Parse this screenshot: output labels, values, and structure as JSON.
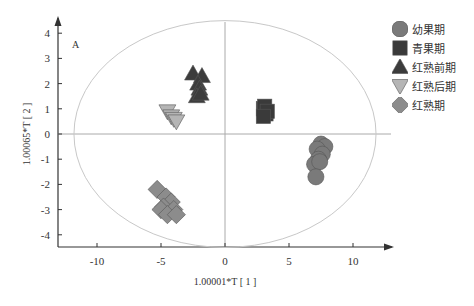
{
  "chart_data": {
    "type": "scatter",
    "title": "",
    "panel_label": "A",
    "xlabel": "1.00001*T [ 1 ]",
    "ylabel": "1.00065*T [ 2 ]",
    "xlim": [
      -13,
      13
    ],
    "ylim": [
      -4.5,
      4.5
    ],
    "xticks": [
      -10,
      -5,
      0,
      5,
      10
    ],
    "yticks": [
      -4,
      -3,
      -2,
      -1,
      0,
      1,
      2,
      3,
      4
    ],
    "grid": false,
    "legend_position": "right",
    "confidence_ellipse": {
      "cx": 0,
      "cy": 0,
      "rx": 11.8,
      "ry": 4.5
    },
    "series": [
      {
        "name": "幼果期",
        "marker": "circle",
        "color": "#7a7a7a",
        "points": [
          [
            7.5,
            -0.4
          ],
          [
            7.8,
            -0.5
          ],
          [
            7.2,
            -0.6
          ],
          [
            7.6,
            -0.8
          ],
          [
            7.3,
            -1.0
          ],
          [
            7.0,
            -1.2
          ],
          [
            7.4,
            -1.1
          ],
          [
            7.1,
            -1.7
          ]
        ]
      },
      {
        "name": "青果期",
        "marker": "square",
        "color": "#3a3a3a",
        "points": [
          [
            3.0,
            1.0
          ],
          [
            3.2,
            0.8
          ],
          [
            3.1,
            1.1
          ],
          [
            3.3,
            0.9
          ],
          [
            3.0,
            0.7
          ]
        ]
      },
      {
        "name": "红熟前期",
        "marker": "triangle-up",
        "color": "#3c3c3c",
        "points": [
          [
            -2.5,
            2.4
          ],
          [
            -1.8,
            2.3
          ],
          [
            -2.1,
            2.0
          ],
          [
            -2.0,
            1.8
          ],
          [
            -2.2,
            1.5
          ],
          [
            -1.9,
            1.6
          ]
        ]
      },
      {
        "name": "红熟后期",
        "marker": "triangle-down",
        "color": "#b5b5b5",
        "points": [
          [
            -4.5,
            0.9
          ],
          [
            -4.2,
            0.7
          ],
          [
            -4.0,
            0.6
          ],
          [
            -3.8,
            0.5
          ]
        ]
      },
      {
        "name": "红熟期",
        "marker": "diamond",
        "color": "#8c8c8c",
        "points": [
          [
            -5.3,
            -2.2
          ],
          [
            -4.6,
            -2.5
          ],
          [
            -4.2,
            -2.7
          ],
          [
            -4.8,
            -2.9
          ],
          [
            -4.0,
            -3.0
          ],
          [
            -5.0,
            -3.0
          ],
          [
            -4.5,
            -3.2
          ],
          [
            -3.8,
            -3.2
          ]
        ]
      }
    ]
  },
  "legend": {
    "items": [
      {
        "label": "幼果期",
        "marker": "circle",
        "color": "#7a7a7a"
      },
      {
        "label": "青果期",
        "marker": "square",
        "color": "#3a3a3a"
      },
      {
        "label": "红熟前期",
        "marker": "triangle-up",
        "color": "#3c3c3c"
      },
      {
        "label": "红熟后期",
        "marker": "triangle-down",
        "color": "#b5b5b5"
      },
      {
        "label": "红熟期",
        "marker": "diamond",
        "color": "#8c8c8c"
      }
    ]
  }
}
